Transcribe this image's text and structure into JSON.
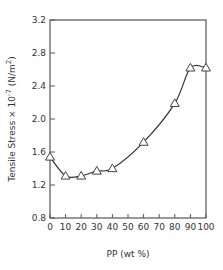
{
  "chart_data": {
    "type": "line",
    "title": "",
    "xlabel": "PP (wt %)",
    "ylabel": "Tensile Stress × 10⁻⁷ (N/m²)",
    "ylabel_parts": {
      "main": "Tensile Stress × 10",
      "exp": "-7",
      "unit_open": " (N/m",
      "unit_exp": "2",
      "unit_close": ")"
    },
    "xlim": [
      0,
      100
    ],
    "ylim": [
      0.8,
      3.2
    ],
    "x_ticks": [
      0,
      10,
      20,
      30,
      40,
      50,
      60,
      70,
      80,
      90,
      100
    ],
    "x_tick_labels": [
      "0",
      "10",
      "20",
      "30",
      "40",
      "50",
      "60",
      "70",
      "80",
      "90",
      "100"
    ],
    "y_ticks": [
      0.8,
      1.2,
      1.6,
      2.0,
      2.4,
      2.8,
      3.2
    ],
    "y_tick_labels": [
      "0.8",
      "1.2",
      "1.6",
      "2.0",
      "2.4",
      "2.8",
      "3.2"
    ],
    "grid": false,
    "legend": null,
    "marker": "open-triangle",
    "series": [
      {
        "name": "Tensile Stress",
        "x": [
          0,
          10,
          20,
          30,
          40,
          60,
          80,
          90,
          100
        ],
        "values": [
          1.54,
          1.31,
          1.31,
          1.37,
          1.4,
          1.72,
          2.19,
          2.62,
          2.62
        ]
      }
    ],
    "fit_curve": "smooth curve through points"
  }
}
